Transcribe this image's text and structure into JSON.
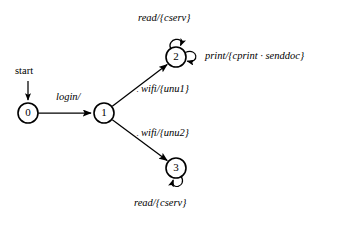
{
  "diagram": {
    "type": "finite-state-machine",
    "start_label": "start",
    "states": [
      {
        "id": "0",
        "label": "0",
        "cx": 28,
        "cy": 113,
        "r": 10
      },
      {
        "id": "1",
        "label": "1",
        "cx": 104,
        "cy": 113,
        "r": 10
      },
      {
        "id": "2",
        "label": "2",
        "cx": 176,
        "cy": 57,
        "r": 10
      },
      {
        "id": "3",
        "label": "3",
        "cx": 176,
        "cy": 168,
        "r": 10
      }
    ],
    "transitions": [
      {
        "from": "start",
        "to": "0",
        "label": ""
      },
      {
        "from": "0",
        "to": "1",
        "label": "login/"
      },
      {
        "from": "1",
        "to": "2",
        "label": "wifi/{unu1}",
        "tick": "·"
      },
      {
        "from": "1",
        "to": "3",
        "label": "wifi/{unu2}",
        "tick": "·"
      },
      {
        "from": "2",
        "to": "2",
        "label": "read/{cserv}",
        "loop": "top"
      },
      {
        "from": "2",
        "to": "2",
        "label": "print/{cprint · senddoc}",
        "loop": "right"
      },
      {
        "from": "3",
        "to": "3",
        "label": "read/{cserv}",
        "loop": "bottom"
      }
    ],
    "labels": {
      "start": "start",
      "login": "login/",
      "wifi_unu1": "wifi/{unu1}",
      "wifi_unu2": "wifi/{unu2}",
      "read_cserv_top": "read/{cserv}",
      "print_cprint_senddoc": "print/{cprint · senddoc}",
      "read_cserv_bottom": "read/{cserv}",
      "tick_upper": "·",
      "tick_lower": "·"
    },
    "colors": {
      "stroke": "#000000",
      "fill": "#ffffff",
      "background": "#ffffff"
    }
  }
}
